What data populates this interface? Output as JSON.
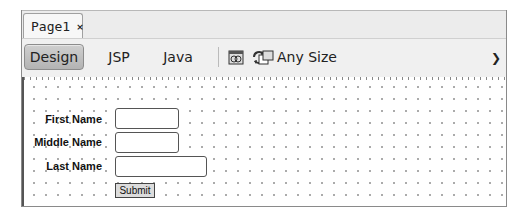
{
  "editor": {
    "tab": {
      "label": "Page1",
      "close_glyph": "×"
    },
    "toolbar": {
      "views": [
        {
          "label": "Design",
          "active": true
        },
        {
          "label": "JSP",
          "active": false
        },
        {
          "label": "Java",
          "active": false
        }
      ],
      "icons": [
        "preview-browser-icon",
        "refresh-icon",
        "target-size-icon"
      ],
      "size_select": {
        "value": "Any Size",
        "glyph": "⌄"
      }
    }
  },
  "form": {
    "fields": [
      {
        "label": "First Name",
        "value": ""
      },
      {
        "label": "Middle Name",
        "value": ""
      },
      {
        "label": "Last Name",
        "value": ""
      }
    ],
    "submit_label": "Submit"
  }
}
